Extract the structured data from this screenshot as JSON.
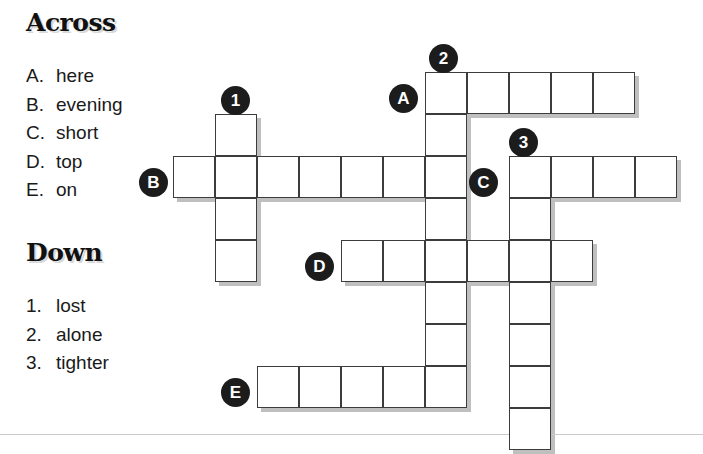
{
  "puzzle": {
    "across": {
      "heading": "Across",
      "clues": [
        {
          "key": "A.",
          "text": "here"
        },
        {
          "key": "B.",
          "text": "evening"
        },
        {
          "key": "C.",
          "text": "short"
        },
        {
          "key": "D.",
          "text": "top"
        },
        {
          "key": "E.",
          "text": "on"
        }
      ]
    },
    "down": {
      "heading": "Down",
      "clues": [
        {
          "key": "1.",
          "text": "lost"
        },
        {
          "key": "2.",
          "text": "alone"
        },
        {
          "key": "3.",
          "text": "tighter"
        }
      ]
    },
    "markers": [
      {
        "label": "1",
        "type": "down",
        "x": 221,
        "y": 86
      },
      {
        "label": "2",
        "type": "down",
        "x": 429,
        "y": 44
      },
      {
        "label": "3",
        "type": "down",
        "x": 509,
        "y": 128
      },
      {
        "label": "A",
        "type": "across",
        "x": 389,
        "y": 84
      },
      {
        "label": "B",
        "type": "across",
        "x": 139,
        "y": 168
      },
      {
        "label": "C",
        "type": "across",
        "x": 469,
        "y": 168
      },
      {
        "label": "D",
        "type": "across",
        "x": 305,
        "y": 252
      },
      {
        "label": "E",
        "type": "across",
        "x": 221,
        "y": 378
      }
    ],
    "entries": [
      {
        "name": "across-a",
        "label": "A",
        "direction": "across",
        "row": 0,
        "col": 6,
        "length": 5
      },
      {
        "name": "across-b",
        "label": "B",
        "direction": "across",
        "row": 2,
        "col": 0,
        "length": 7
      },
      {
        "name": "across-c",
        "label": "C",
        "direction": "across",
        "row": 2,
        "col": 8,
        "length": 4
      },
      {
        "name": "across-d",
        "label": "D",
        "direction": "across",
        "row": 4,
        "col": 4,
        "length": 6
      },
      {
        "name": "across-e",
        "label": "E",
        "direction": "across",
        "row": 7,
        "col": 2,
        "length": 5
      },
      {
        "name": "down-1",
        "label": "1",
        "direction": "down",
        "row": 1,
        "col": 1,
        "length": 4
      },
      {
        "name": "down-2",
        "label": "2",
        "direction": "down",
        "row": 0,
        "col": 6,
        "length": 8
      },
      {
        "name": "down-3",
        "label": "3",
        "direction": "down",
        "row": 2,
        "col": 8,
        "length": 7
      }
    ],
    "geometry": {
      "origin_x": 173,
      "origin_y": 72,
      "cell_size": 42
    }
  }
}
